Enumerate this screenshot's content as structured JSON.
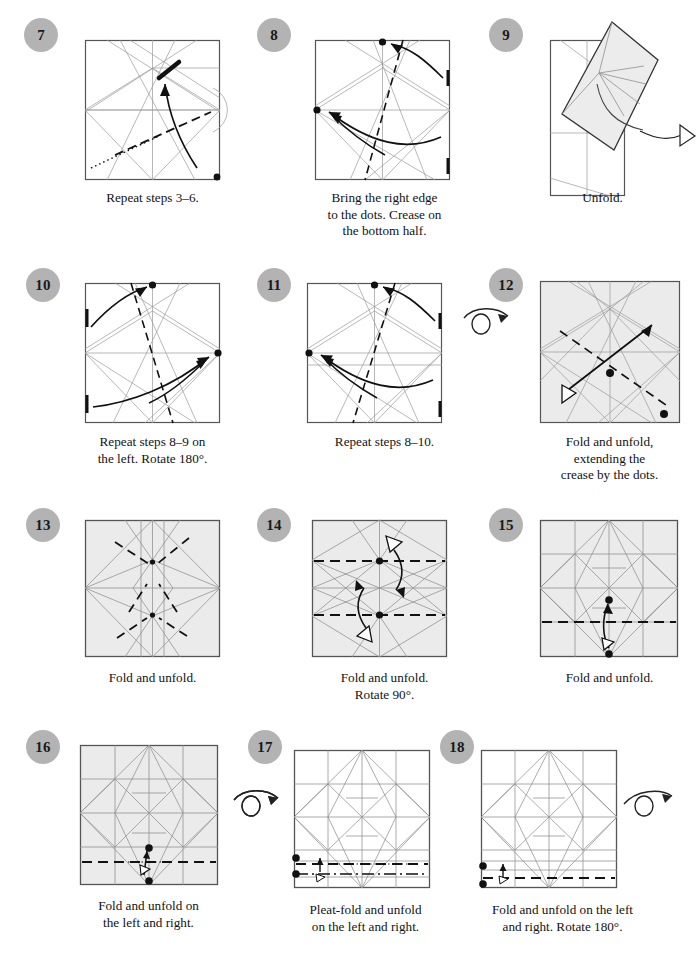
{
  "document": {
    "type": "origami-instruction-page",
    "columns": 3,
    "rows": 4,
    "paper_front_color": "#ffffff",
    "paper_back_color": "#ebebeb",
    "badge_color": "#b3b3b3",
    "crease_color": "#8a8a8a",
    "edge_color": "#444444",
    "fold_line_color": "#111111"
  },
  "steps": [
    {
      "number": "7",
      "caption": "Repeat steps 3–6.",
      "shaded": false,
      "symbols": [
        "valley-fold-dashed",
        "x-ray-dotted",
        "fold-arrow",
        "reference-dot"
      ]
    },
    {
      "number": "8",
      "caption": "Bring the right edge\nto the dots. Crease on\nthe bottom half.",
      "shaded": false,
      "symbols": [
        "fold-arrow",
        "reference-dot",
        "edge-tick",
        "valley-fold-dashed"
      ]
    },
    {
      "number": "9",
      "caption": "Unfold.",
      "shaded": true,
      "symbols": [
        "unfold-arrow-hollow"
      ]
    },
    {
      "number": "10",
      "caption": "Repeat steps 8–9 on\nthe left. Rotate 180°.",
      "shaded": false,
      "symbols": [
        "fold-arrow",
        "reference-dot",
        "edge-tick",
        "valley-fold-dashed"
      ]
    },
    {
      "number": "11",
      "caption": "Repeat steps 8–10.",
      "shaded": false,
      "symbols": [
        "fold-arrow",
        "reference-dot",
        "edge-tick",
        "valley-fold-dashed"
      ],
      "turn_over": true
    },
    {
      "number": "12",
      "caption": "Fold and unfold,\nextending the\ncrease by the dots.",
      "shaded": true,
      "symbols": [
        "fold-and-unfold-arrow",
        "reference-dot",
        "valley-fold-dashed"
      ]
    },
    {
      "number": "13",
      "caption": "Fold and unfold.",
      "shaded": true,
      "symbols": [
        "valley-fold-dashed"
      ]
    },
    {
      "number": "14",
      "caption": "Fold and unfold.\nRotate 90°.",
      "shaded": true,
      "symbols": [
        "fold-and-unfold-arrow",
        "reference-dot",
        "valley-fold-dashed"
      ]
    },
    {
      "number": "15",
      "caption": "Fold and unfold.",
      "shaded": true,
      "symbols": [
        "fold-and-unfold-arrow",
        "reference-dot",
        "valley-fold-dashed"
      ]
    },
    {
      "number": "16",
      "caption": "Fold and unfold on\nthe left and right.",
      "shaded": true,
      "symbols": [
        "fold-and-unfold-arrow",
        "reference-dot",
        "valley-fold-dashed"
      ],
      "turn_over": true
    },
    {
      "number": "17",
      "caption": "Pleat-fold and unfold\non the left and right.",
      "shaded": true,
      "symbols": [
        "pleat-arrow",
        "reference-dot",
        "valley-fold-dashed",
        "mountain-fold-dashdot"
      ]
    },
    {
      "number": "18",
      "caption": "Fold and unfold on the left\nand right. Rotate 180°.",
      "shaded": true,
      "symbols": [
        "fold-and-unfold-arrow",
        "reference-dot",
        "valley-fold-dashed"
      ],
      "turn_over": true
    }
  ]
}
